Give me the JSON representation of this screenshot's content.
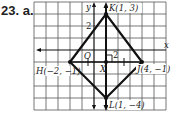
{
  "problem": {
    "number_label": "23. a."
  },
  "axes": {
    "x_label": "x",
    "y_label": "y",
    "origin_label": "O",
    "tick_label_y": "2",
    "tick_label_x": "2"
  },
  "points": [
    {
      "name": "K",
      "label": "K(1, 3)",
      "x": 1,
      "y": 3
    },
    {
      "name": "H",
      "label": "H(−2, −1)",
      "x": -2,
      "y": -1
    },
    {
      "name": "J",
      "label": "J(4, −1)",
      "x": 4,
      "y": -1
    },
    {
      "name": "L",
      "label": "L(1, −4)",
      "x": 1,
      "y": -4
    },
    {
      "name": "X",
      "label": "X",
      "x": 1,
      "y": -1
    }
  ],
  "colors": {
    "grid": "#555555",
    "figure": "#111111",
    "text": "#222222"
  }
}
